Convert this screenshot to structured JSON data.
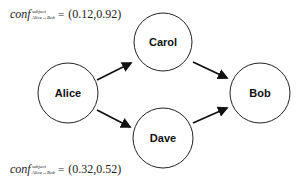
{
  "nodes": [
    {
      "id": "alice",
      "label": "Alice",
      "cx": 68,
      "cy": 93,
      "r": 30
    },
    {
      "id": "carol",
      "label": "Carol",
      "cx": 163,
      "cy": 42,
      "r": 29
    },
    {
      "id": "dave",
      "label": "Dave",
      "cx": 163,
      "cy": 138,
      "r": 30
    },
    {
      "id": "bob",
      "label": "Bob",
      "cx": 260,
      "cy": 93,
      "r": 30
    }
  ],
  "edges": [
    {
      "from": "Alice",
      "to": "Carol"
    },
    {
      "from": "Alice",
      "to": "Dave"
    },
    {
      "from": "Carol",
      "to": "Bob"
    },
    {
      "from": "Dave",
      "to": "Bob"
    }
  ],
  "formulas": {
    "top": {
      "base": "conf",
      "superscript": "subject",
      "subscript": "Alice→Bob",
      "equals": "=",
      "value": "(0.12,0.92)"
    },
    "bottom": {
      "base": "conf",
      "superscript": "subject",
      "subscript": "Alice→Bob",
      "equals": "=",
      "value": "(0.32,0.52)"
    }
  },
  "colors": {
    "stroke": "#222222",
    "text": "#111111",
    "background": "#ffffff"
  }
}
